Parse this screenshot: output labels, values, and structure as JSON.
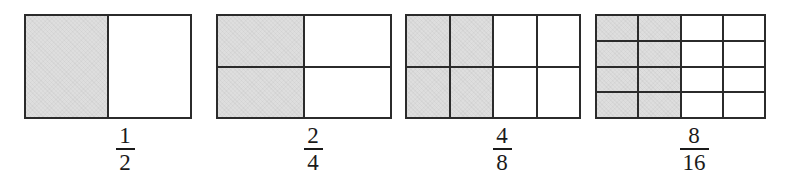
{
  "figure": {
    "shade_color": "#dedede",
    "line_color": "#2b2b2b",
    "background_color": "#ffffff"
  },
  "chart_data": {
    "type": "bar",
    "title": "",
    "subtitle": "",
    "xlabel": "",
    "ylabel": "",
    "categories": [
      "1/2",
      "2/4",
      "4/8",
      "8/16"
    ],
    "values": [
      0.5,
      0.5,
      0.5,
      0.5
    ],
    "ylim": [
      0,
      1
    ],
    "grid": false,
    "legend": "none",
    "annotations": [
      "All four area models show one half shaded",
      "Equivalent fractions: 1/2 = 2/4 = 4/8 = 8/16"
    ]
  },
  "models": [
    {
      "id": "model-1",
      "left": 24,
      "width": 168,
      "height": 105,
      "cols": 1,
      "rows": 1,
      "shaded_cols": 0,
      "half_split": true,
      "shaded_count": 1,
      "total_count": 2,
      "label": {
        "numerator": "1",
        "denominator": "2",
        "center": 125
      }
    },
    {
      "id": "model-2",
      "left": 216,
      "width": 176,
      "height": 105,
      "cols": 2,
      "rows": 2,
      "shaded_cols": 1,
      "half_split": false,
      "shaded_count": 2,
      "total_count": 4,
      "label": {
        "numerator": "2",
        "denominator": "4",
        "center": 313
      }
    },
    {
      "id": "model-3",
      "left": 405,
      "width": 176,
      "height": 105,
      "cols": 4,
      "rows": 2,
      "shaded_cols": 2,
      "half_split": false,
      "shaded_count": 4,
      "total_count": 8,
      "label": {
        "numerator": "4",
        "denominator": "8",
        "center": 502
      }
    },
    {
      "id": "model-4",
      "left": 595,
      "width": 171,
      "height": 105,
      "cols": 4,
      "rows": 4,
      "shaded_cols": 2,
      "half_split": false,
      "shaded_count": 8,
      "total_count": 16,
      "label": {
        "numerator": "8",
        "denominator": "16",
        "center": 694
      }
    }
  ]
}
